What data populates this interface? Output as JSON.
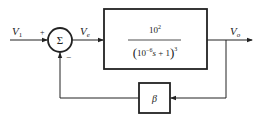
{
  "diagram": {
    "type": "feedback-control-block-diagram",
    "input_label": "V",
    "input_subscript": "1",
    "plus_sign": "+",
    "minus_sign": "−",
    "summer_symbol": "Σ",
    "error_label": "V",
    "error_subscript": "e",
    "output_label": "V",
    "output_subscript": "o",
    "forward_block": {
      "numerator_base": "10",
      "numerator_exp": "2",
      "denominator_open": "(",
      "denominator_base": "10",
      "denominator_exp": "−6",
      "denominator_var": "s",
      "denominator_rest": " + 1",
      "denominator_close": ")",
      "denominator_power": "3"
    },
    "feedback_block": {
      "label": "β"
    },
    "colors": {
      "stroke": "#222222",
      "background": "#ffffff"
    }
  }
}
